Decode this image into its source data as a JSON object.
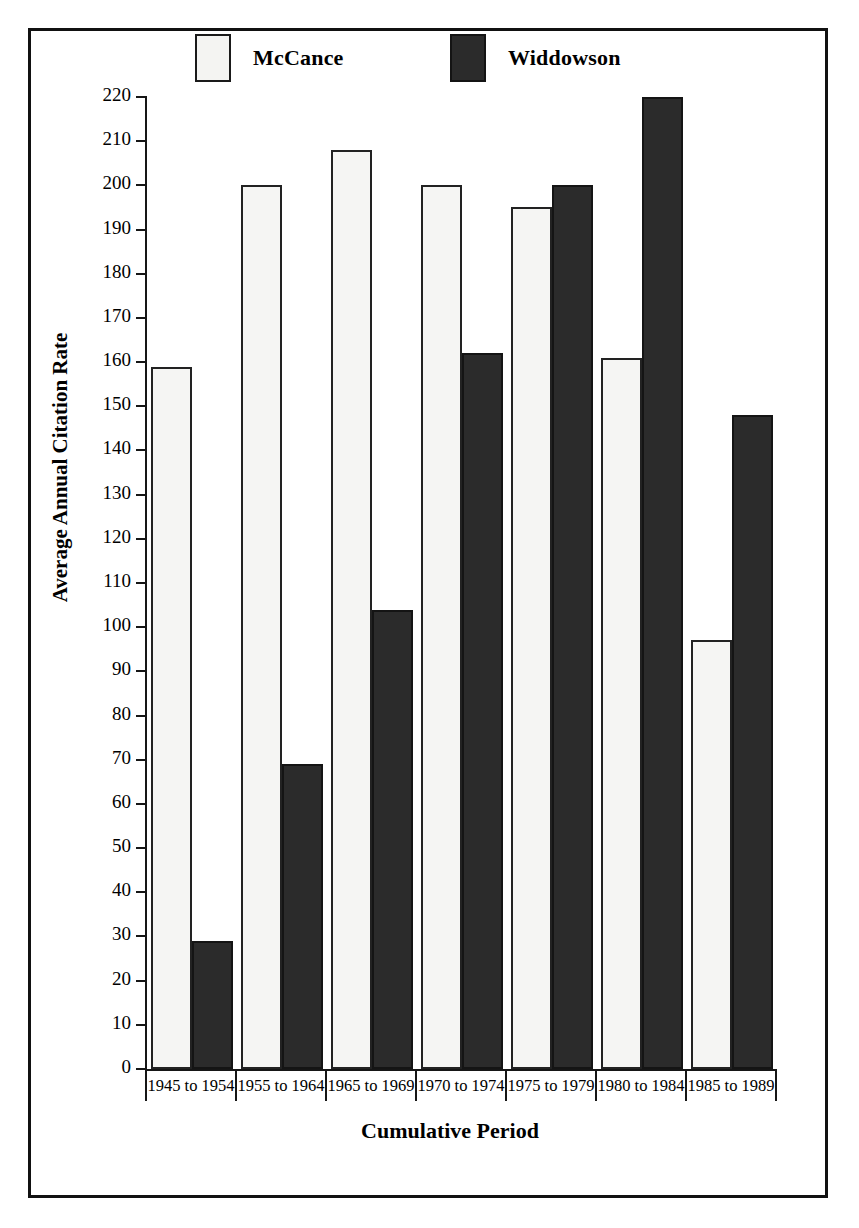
{
  "figure": {
    "frame": true,
    "background": "#ffffff",
    "ink_color": "#161616"
  },
  "legend": {
    "position": "top",
    "entries": [
      {
        "label": "McCance",
        "swatch": "light-square-swatch",
        "color": "#f4f4f2"
      },
      {
        "label": "Widdowson",
        "swatch": "dark-square-swatch",
        "color": "#2b2b2b"
      }
    ]
  },
  "axes": {
    "ylabel": "Average Annual Citation Rate",
    "xlabel": "Cumulative Period",
    "yticks": [
      0,
      10,
      20,
      30,
      40,
      50,
      60,
      70,
      80,
      90,
      100,
      110,
      120,
      130,
      140,
      150,
      160,
      170,
      180,
      190,
      200,
      210,
      220
    ]
  },
  "chart_data": {
    "type": "bar",
    "title": "",
    "subtitle": "",
    "xlabel": "Cumulative Period",
    "ylabel": "Average Annual Citation Rate",
    "ylim": [
      0,
      220
    ],
    "ytick_step": 10,
    "grid": false,
    "legend_position": "top",
    "categories": [
      "1945 to 1954",
      "1955 to 1964",
      "1965 to 1969",
      "1970 to 1974",
      "1975 to 1979",
      "1980 to 1984",
      "1985 to 1989"
    ],
    "series": [
      {
        "name": "McCance",
        "color": "#f4f4f2",
        "values": [
          159,
          200,
          208,
          200,
          195,
          161,
          97
        ]
      },
      {
        "name": "Widdowson",
        "color": "#2b2b2b",
        "values": [
          29,
          69,
          104,
          162,
          200,
          220,
          148
        ]
      }
    ]
  }
}
